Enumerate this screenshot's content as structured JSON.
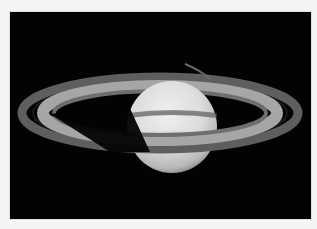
{
  "image": {
    "subject": "Saturn with its ring system",
    "alt": "Saturn and its rings against black space",
    "colors": {
      "page_background": "#f4f4f4",
      "space": "#030303",
      "planet_light": "#e6e6e6",
      "planet_shadow": "#8a8a8a",
      "ring_outer": "#6a6a6a",
      "ring_inner": "#b4b4b4"
    }
  }
}
